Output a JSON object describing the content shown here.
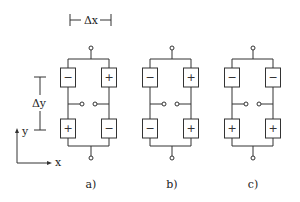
{
  "dimensions": {
    "dx_label": "Δx",
    "dy_label": "Δy"
  },
  "axes": {
    "x_label": "x",
    "y_label": "y"
  },
  "diagrams": [
    {
      "label": "a)",
      "cx": 91,
      "left_x": 68,
      "right_x": 109,
      "cells": {
        "top_left": "−",
        "top_right": "+",
        "bottom_left": "+",
        "bottom_right": "−"
      }
    },
    {
      "label": "b)",
      "cx": 172,
      "left_x": 150,
      "right_x": 191,
      "cells": {
        "top_left": "−",
        "top_right": "+",
        "bottom_left": "−",
        "bottom_right": "+"
      }
    },
    {
      "label": "c)",
      "cx": 253,
      "left_x": 232,
      "right_x": 273,
      "cells": {
        "top_left": "−",
        "top_right": "−",
        "bottom_left": "+",
        "bottom_right": "+"
      }
    }
  ]
}
